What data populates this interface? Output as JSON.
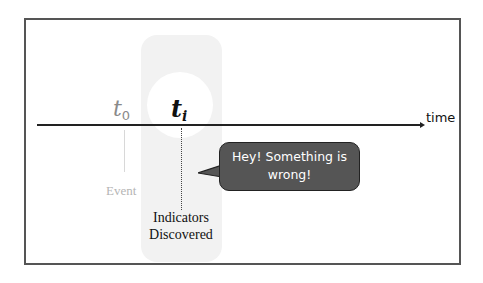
{
  "diagram": {
    "axis": {
      "label": "time"
    },
    "markers": [
      {
        "symbol": "t",
        "subscript": "0",
        "caption": "Event",
        "emphasis": "faded"
      },
      {
        "symbol": "t",
        "subscript": "i",
        "caption_lines": [
          "Indicators",
          "Discovered"
        ],
        "emphasis": "highlighted"
      }
    ],
    "callout": {
      "lines": [
        "Hey! Something is",
        "wrong!"
      ]
    }
  },
  "colors": {
    "frame": "#555555",
    "highlight_column": "#f2f2f2",
    "callout_fill": "#555555",
    "faded_text": "#8a8a8a"
  }
}
